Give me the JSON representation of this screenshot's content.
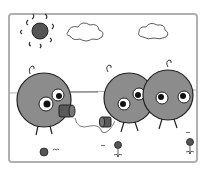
{
  "illustration": {
    "description": "Cartoon of three round gray characters; two talk through a tin-can string telephone under a sun and clouds, with small flowers on the ground",
    "colors": {
      "background": "#ffffff",
      "border": "#b0b0b0",
      "character": "#8c8c8c",
      "outline": "#222222",
      "sun": "#555555",
      "can": "#5a5a5a"
    },
    "characters": [
      "left-character",
      "middle-character",
      "right-character"
    ],
    "props": [
      "sun",
      "cloud-left",
      "cloud-right",
      "tin-can-left",
      "tin-can-right",
      "string",
      "flower-left",
      "flower-middle",
      "flower-right"
    ]
  }
}
